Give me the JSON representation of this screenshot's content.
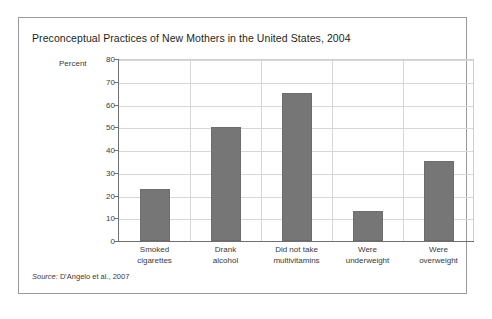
{
  "figure": {
    "title": "Preconceptual Practices of New Mothers in the United States, 2004",
    "source_label": "Source:",
    "source_text": " D'Angelo et al., 2007"
  },
  "colors": {
    "bar_fill": "#767676",
    "bar_border": "#6d6d6d",
    "gridline": "#d7d7d7",
    "axis_line": "#6f6f6f",
    "frame_border": "#9a9a9a",
    "text": "#3a3a3a",
    "title_text": "#231f20",
    "background": "#ffffff"
  },
  "chart_data": {
    "type": "bar",
    "title": "Preconceptual Practices of New Mothers in the United States, 2004",
    "xlabel": "",
    "ylabel": "Percent",
    "ylim": [
      0,
      80
    ],
    "yticks": [
      0,
      10,
      20,
      30,
      40,
      50,
      60,
      70,
      80
    ],
    "ytick_labels": [
      "0",
      "10",
      "20",
      "30",
      "40",
      "50",
      "60",
      "70",
      "80"
    ],
    "grid": "both",
    "legend": "none",
    "categories": [
      "Smoked cigarettes",
      "Drank alcohol",
      "Did not take multivitamins",
      "Were underweight",
      "Were overweight"
    ],
    "category_lines": [
      [
        "Smoked",
        "cigarettes"
      ],
      [
        "Drank",
        "alcohol"
      ],
      [
        "Did not take",
        "multivitamins"
      ],
      [
        "Were",
        "underweight"
      ],
      [
        "Were",
        "overweight"
      ]
    ],
    "values": [
      23,
      50,
      65,
      13,
      35
    ]
  }
}
